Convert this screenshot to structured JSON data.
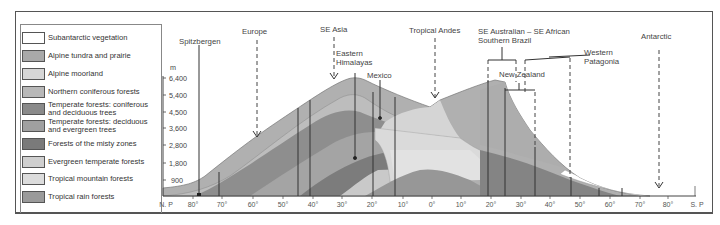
{
  "diagram": {
    "type": "vegetation zonation profile",
    "y_axis": {
      "unit": "m",
      "ticks": [
        "6,400",
        "5,400",
        "4,500",
        "3,600",
        "2,800",
        "1,800",
        "900"
      ]
    },
    "x_axis": {
      "ticks": [
        "N. P",
        "80°",
        "70°",
        "60°",
        "50°",
        "40°",
        "30°",
        "20°",
        "10°",
        "0°",
        "10°",
        "20°",
        "30°",
        "40°",
        "50°",
        "60°",
        "70°",
        "80°",
        "S. P"
      ]
    },
    "legend": [
      {
        "label": "Subantarctic vegetation",
        "color": "#ffffff"
      },
      {
        "label": "Alpine tundra and prairie",
        "color": "#a9a9a9"
      },
      {
        "label": "Alpine moorland",
        "color": "#d6d6d6"
      },
      {
        "label": "Northern coniferous forests",
        "color": "#b8b8b8"
      },
      {
        "label": "Temperate forests: coniferous and deciduous trees",
        "line1": "Temperate forests: coniferous",
        "line2": "and deciduous trees",
        "color": "#8a8a8a"
      },
      {
        "label": "Temperate forests: deciduous and evergreen trees",
        "line1": "Temperate forests: deciduous",
        "line2": "and evergreen trees",
        "color": "#a0a0a0"
      },
      {
        "label": "Forests of the misty zones",
        "color": "#7a7a7a"
      },
      {
        "label": "Evergreen temperate forests",
        "color": "#cfcfcf"
      },
      {
        "label": "Tropical mountain forests",
        "color": "#dcdcdc"
      },
      {
        "label": "Tropical rain forests",
        "color": "#9a9a9a"
      }
    ],
    "locations": [
      {
        "label": "Spitzbergen",
        "marker": "solid"
      },
      {
        "label": "Europe",
        "marker": "dashed-arrow"
      },
      {
        "label": "SE Asia",
        "marker": "dashed-arrow"
      },
      {
        "label": "Eastern",
        "label2": "Himalayas",
        "marker": "solid"
      },
      {
        "label": "Mexico",
        "marker": "solid"
      },
      {
        "label": "Tropical Andes",
        "marker": "dashed-arrow"
      },
      {
        "label": "SE Australian – SE African",
        "label2": "Southern Brazil",
        "marker": "bracket"
      },
      {
        "label": "New Zealand",
        "marker": "bracket"
      },
      {
        "label": "Western",
        "label2": "Patagonia",
        "marker": "bracket"
      },
      {
        "label": "Antarctic",
        "marker": "dashed-arrow"
      }
    ]
  }
}
